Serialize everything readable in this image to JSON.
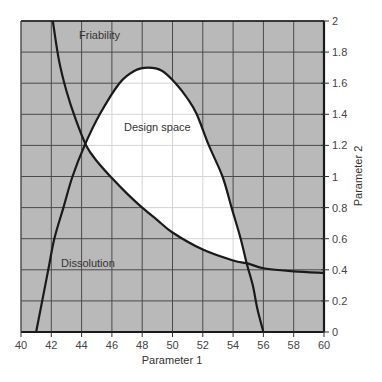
{
  "chart_data": {
    "type": "line",
    "title": "",
    "xlabel": "Parameter 1",
    "ylabel": "Parameter 2",
    "xlim": [
      40,
      60
    ],
    "ylim": [
      0,
      2
    ],
    "x_ticks": [
      40,
      42,
      44,
      46,
      48,
      50,
      52,
      54,
      56,
      58,
      60
    ],
    "y_ticks": [
      0,
      0.2,
      0.4,
      0.6,
      0.8,
      1,
      1.2,
      1.4,
      1.6,
      1.8,
      2
    ],
    "y_axis_position": "right",
    "grid": true,
    "colors": {
      "excluded_region": "#b9b9b9",
      "design_space": "#ffffff",
      "grid_dark": "#4a4a4a",
      "grid_light": "#d4d4d4",
      "curve": "#1a1a1a"
    },
    "series": [
      {
        "name": "Dissolution",
        "description": "boundary curve; region under it (above 0) is acceptable for dissolution",
        "x": [
          41.0,
          41.4,
          41.8,
          42.2,
          42.8,
          43.4,
          44.2,
          45.2,
          46.5,
          47.5,
          48.4,
          49.3,
          50.2,
          51.0,
          51.6,
          52.4,
          53.3,
          53.9,
          54.5,
          54.9,
          55.3,
          55.6,
          56.0
        ],
        "y": [
          0.0,
          0.2,
          0.4,
          0.6,
          0.8,
          1.0,
          1.2,
          1.4,
          1.6,
          1.68,
          1.7,
          1.68,
          1.6,
          1.5,
          1.4,
          1.2,
          1.0,
          0.8,
          0.6,
          0.44,
          0.3,
          0.15,
          0.0
        ]
      },
      {
        "name": "Friability",
        "description": "boundary curve; region above it is acceptable for friability",
        "x": [
          42.1,
          42.5,
          43.0,
          43.6,
          44.3,
          45.0,
          46.0,
          47.0,
          48.0,
          49.0,
          50.0,
          52.0,
          54.0,
          55.0,
          56.0,
          58.0,
          60.0
        ],
        "y": [
          2.0,
          1.75,
          1.55,
          1.37,
          1.2,
          1.1,
          0.99,
          0.89,
          0.8,
          0.72,
          0.64,
          0.53,
          0.46,
          0.44,
          0.41,
          0.39,
          0.38
        ]
      }
    ],
    "annotations": [
      {
        "text": "Friability",
        "x": 45.8,
        "y": 1.9
      },
      {
        "text": "Design space",
        "x": 50.7,
        "y": 1.3
      },
      {
        "text": "Dissolution",
        "x": 43.8,
        "y": 0.42
      }
    ],
    "intersections": [
      {
        "x": 44.3,
        "y": 1.2
      },
      {
        "x": 54.9,
        "y": 0.44
      }
    ]
  },
  "labels": {
    "xlabel": "Parameter 1",
    "ylabel": "Parameter 2",
    "friability": "Friability",
    "design_space": "Design space",
    "dissolution": "Dissolution"
  }
}
